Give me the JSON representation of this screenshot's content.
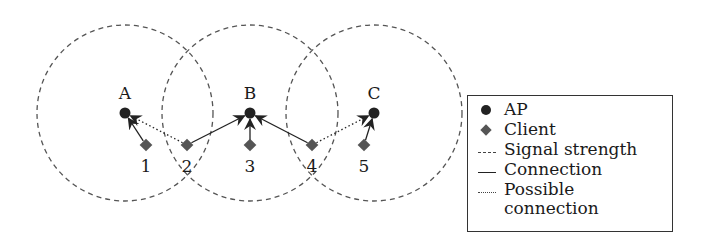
{
  "diagram": {
    "access_points": [
      {
        "id": "A",
        "label": "A",
        "x": 125,
        "y": 113
      },
      {
        "id": "B",
        "label": "B",
        "x": 250,
        "y": 113
      },
      {
        "id": "C",
        "label": "C",
        "x": 374,
        "y": 113
      }
    ],
    "signal_radius": 88,
    "clients": [
      {
        "id": "1",
        "label": "1",
        "x": 146,
        "y": 145
      },
      {
        "id": "2",
        "label": "2",
        "x": 187,
        "y": 145
      },
      {
        "id": "3",
        "label": "3",
        "x": 250,
        "y": 145
      },
      {
        "id": "4",
        "label": "4",
        "x": 312,
        "y": 145
      },
      {
        "id": "5",
        "label": "5",
        "x": 364,
        "y": 145
      }
    ],
    "links": [
      {
        "from": "1",
        "to": "A",
        "type": "connection"
      },
      {
        "from": "2",
        "to": "A",
        "type": "possible"
      },
      {
        "from": "2",
        "to": "B",
        "type": "connection"
      },
      {
        "from": "3",
        "to": "B",
        "type": "connection"
      },
      {
        "from": "4",
        "to": "B",
        "type": "connection"
      },
      {
        "from": "4",
        "to": "C",
        "type": "possible"
      },
      {
        "from": "5",
        "to": "C",
        "type": "connection"
      }
    ],
    "colors": {
      "ap": "#222222",
      "client": "#555555",
      "signal": "#555555",
      "line": "#222222"
    }
  },
  "legend": {
    "items": [
      {
        "symbol": "ap-dot",
        "label": "AP"
      },
      {
        "symbol": "client-diamond",
        "label": "Client"
      },
      {
        "symbol": "dashed-line",
        "label": "Signal strength"
      },
      {
        "symbol": "solid-line",
        "label": "Connection"
      },
      {
        "symbol": "dotted-line",
        "label": "Possible connection"
      }
    ]
  }
}
